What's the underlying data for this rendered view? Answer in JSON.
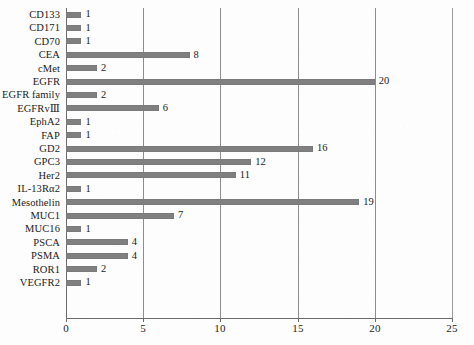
{
  "chart_data": {
    "type": "bar",
    "orientation": "horizontal",
    "title": "",
    "subtitle": "",
    "xlabel": "",
    "ylabel": "",
    "xlim": [
      0,
      25
    ],
    "ylim": null,
    "grid": "vertical gridlines at 0, 5, 10, 15, 20, 25",
    "legend": null,
    "legend_position": "none",
    "xticks": [
      "0",
      "5",
      "10",
      "15",
      "20",
      "25"
    ],
    "xtick_values": [
      0,
      5,
      10,
      15,
      20,
      25
    ],
    "bar_color": "#808080",
    "background_color": "#fdfdfd",
    "axis_color": "#6a6a6a",
    "label_color": "#1a1a1a",
    "data_labels_shown": true,
    "categories": [
      "CD133",
      "CD171",
      "CD70",
      "CEA",
      "cMet",
      "EGFR",
      "EGFR family",
      "EGFRvⅢ",
      "EphA2",
      "FAP",
      "GD2",
      "GPC3",
      "Her2",
      "IL-13Rα2",
      "Mesothelin",
      "MUC1",
      "MUC16",
      "PSCA",
      "PSMA",
      "ROR1",
      "VEGFR2"
    ],
    "values": [
      1,
      1,
      1,
      8,
      2,
      20,
      2,
      6,
      1,
      1,
      16,
      12,
      11,
      1,
      19,
      7,
      1,
      4,
      4,
      2,
      1
    ],
    "value_labels": [
      "1",
      "1",
      "1",
      "8",
      "2",
      "20",
      "2",
      "6",
      "1",
      "1",
      "16",
      "12",
      "11",
      "1",
      "19",
      "7",
      "1",
      "4",
      "4",
      "2",
      "1"
    ]
  }
}
